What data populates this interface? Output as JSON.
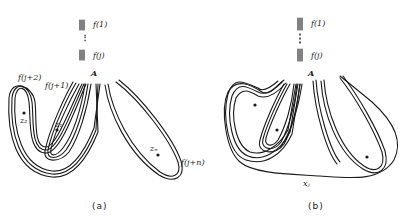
{
  "panels": [
    {
      "id": "a",
      "caption": "(a)",
      "stack_labels": {
        "top": "f(1)",
        "dots": "⋮",
        "bottom": "f(j)"
      },
      "point_label": "A",
      "curve_labels": {
        "j_plus_2": "f(j+2)",
        "j_plus_1": "f(j+1)",
        "j_plus_n": "f(j+n)"
      },
      "point_labels": {
        "z1": "z₁",
        "z2": "z₂",
        "zn": "zₙ"
      }
    },
    {
      "id": "b",
      "caption": "(b)",
      "stack_labels": {
        "top": "f(1)",
        "dots": "⋮",
        "bottom": "f(j)"
      },
      "point_label": "A",
      "boundary_label": "xⱼ"
    }
  ],
  "colors": {
    "ink": "#1a1a1a",
    "background": "#ffffff"
  }
}
